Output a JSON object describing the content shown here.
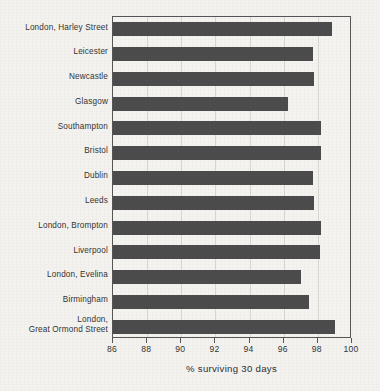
{
  "chart_data": {
    "type": "bar",
    "orientation": "horizontal",
    "title": "",
    "xlabel": "% surviving 30 days",
    "ylabel": "",
    "xlim": [
      86,
      100
    ],
    "xticks": [
      86,
      88,
      90,
      92,
      94,
      96,
      98,
      100
    ],
    "grid": true,
    "legend": false,
    "bar_color": "#4c4c4c",
    "background_color": "#f3f2ee",
    "categories": [
      "London, Harley Street",
      "Leicester",
      "Newcastle",
      "Glasgow",
      "Southampton",
      "Bristol",
      "Dublin",
      "Leeds",
      "London, Brompton",
      "Liverpool",
      "London, Evelina",
      "Birmingham",
      "London,\nGreat Ormond Street"
    ],
    "values": [
      98.8,
      97.7,
      97.8,
      96.25,
      98.2,
      98.2,
      97.7,
      97.8,
      98.2,
      98.1,
      97.0,
      97.5,
      99.0
    ]
  }
}
